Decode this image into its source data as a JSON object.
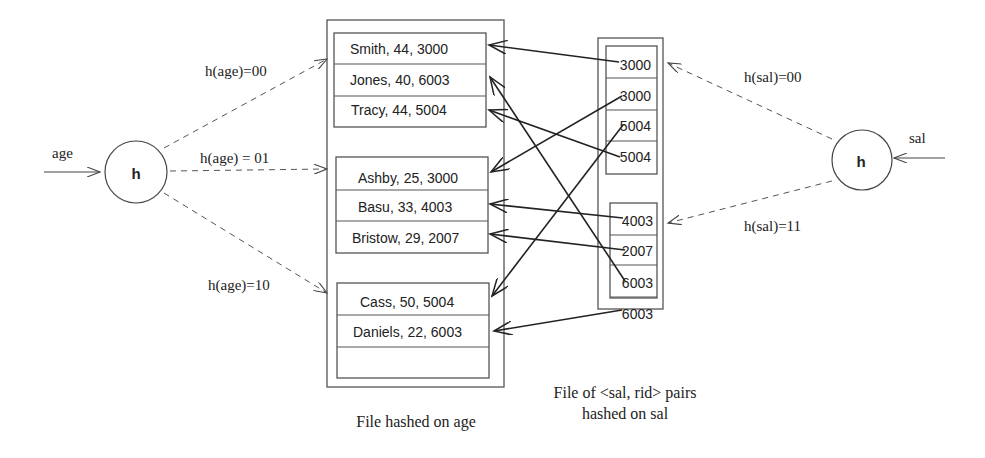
{
  "age_file": {
    "caption": "File hashed on age",
    "buckets": [
      {
        "hash": "h(age)=00",
        "records": [
          "Smith, 44, 3000",
          "Jones, 40, 6003",
          "Tracy, 44, 5004"
        ]
      },
      {
        "hash": "h(age) = 01",
        "records": [
          "Ashby, 25, 3000",
          "Basu, 33, 4003",
          "Bristow, 29, 2007"
        ]
      },
      {
        "hash": "h(age)=10",
        "records": [
          "Cass, 50, 5004",
          "Daniels, 22, 6003",
          ""
        ]
      }
    ]
  },
  "sal_file": {
    "caption_line1": "File of <sal, rid> pairs",
    "caption_line2": "hashed on sal",
    "buckets": [
      {
        "hash": "h(sal)=00",
        "entries": [
          "3000",
          "3000",
          "5004",
          "5004"
        ]
      },
      {
        "hash": "h(sal)=11",
        "entries": [
          "4003",
          "2007",
          "6003",
          "6003"
        ]
      }
    ]
  },
  "age_hash": {
    "input_label": "age",
    "node_label": "h"
  },
  "sal_hash": {
    "input_label": "sal",
    "node_label": "h"
  },
  "pointers": [
    {
      "from": "3000 (sal bucket 00, slot 1)",
      "to": "Smith, 44, 3000"
    },
    {
      "from": "3000 (sal bucket 00, slot 2)",
      "to": "Ashby, 25, 3000"
    },
    {
      "from": "5004 (sal bucket 00, slot 3)",
      "to": "Cass, 50, 5004"
    },
    {
      "from": "5004 (sal bucket 00, slot 4)",
      "to": "Tracy, 44, 5004"
    },
    {
      "from": "4003 (sal bucket 11, slot 1)",
      "to": "Basu, 33, 4003"
    },
    {
      "from": "2007 (sal bucket 11, slot 2)",
      "to": "Bristow, 29, 2007"
    },
    {
      "from": "6003 (sal bucket 11, slot 3)",
      "to": "Jones, 40, 6003"
    },
    {
      "from": "6003 (sal bucket 11, slot 4)",
      "to": "Daniels, 22, 6003"
    }
  ]
}
